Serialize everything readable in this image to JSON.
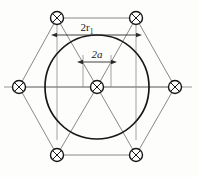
{
  "figure": {
    "type": "engineering-diagram",
    "background_color": "#fdfdfc",
    "line_color": "#6e6e6e",
    "heavy_line_color": "#1a1a1a",
    "labels": {
      "outer_diameter": {
        "base": "2r",
        "subscript": "1",
        "full": "2r1"
      },
      "inner_diameter": {
        "base": "2a",
        "full": "2a"
      }
    },
    "nodes": [
      {
        "name": "node-top-left",
        "cx": 57,
        "cy": 18,
        "r": 6.5
      },
      {
        "name": "node-top-right",
        "cx": 136,
        "cy": 18,
        "r": 6.5
      },
      {
        "name": "node-middle-left",
        "cx": 19,
        "cy": 87,
        "r": 6.5
      },
      {
        "name": "node-center",
        "cx": 97,
        "cy": 87,
        "r": 6.5
      },
      {
        "name": "node-middle-right",
        "cx": 175,
        "cy": 87,
        "r": 6.5
      },
      {
        "name": "node-bottom-left",
        "cx": 57,
        "cy": 155,
        "r": 6.5
      },
      {
        "name": "node-bottom-right",
        "cx": 136,
        "cy": 155,
        "r": 6.5
      }
    ],
    "main_circle": {
      "cx": 97,
      "cy": 87,
      "r": 52
    },
    "dimensions": [
      {
        "name": "dim-2r1",
        "y": 35,
        "x1": 57,
        "x2": 136,
        "label": "2r1"
      },
      {
        "name": "dim-2a",
        "y": 62,
        "x1": 83,
        "x2": 111,
        "label": "2a"
      }
    ]
  }
}
